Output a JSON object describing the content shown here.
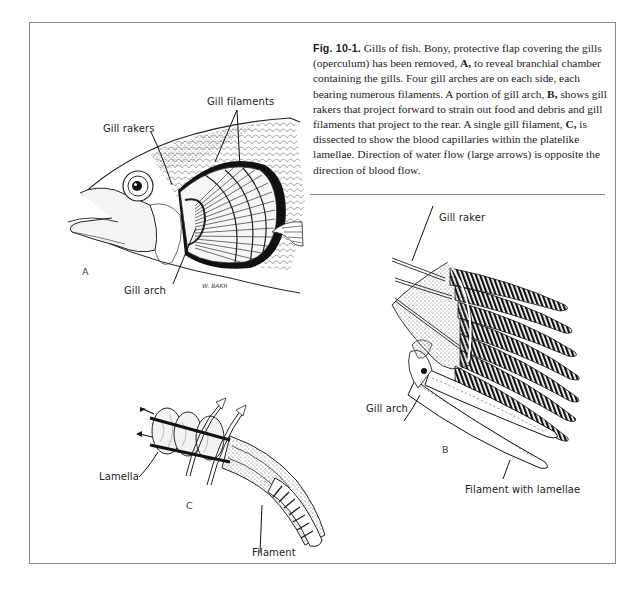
{
  "figure": {
    "number_prefix": "Fig.",
    "number": "10-1.",
    "caption_parts": [
      " Gills of fish. Bony, protective flap covering the gills (operculum) has been removed, ",
      "A,",
      " to reveal branchial chamber containing the gills. Four gill arches are on each side, each bearing numerous filaments. A portion of gill arch, ",
      "B,",
      " shows gill rakers that project forward to strain out food and debris and gill filaments that project to the rear. A single gill filament, ",
      "C,",
      " is dissected to show the blood capillaries within the platelike lamellae. Direction of water flow (large arrows) is opposite the direction of blood flow."
    ]
  },
  "panel_a": {
    "letter": "A",
    "labels": {
      "gill_filaments": "Gill filaments",
      "gill_rakers": "Gill rakers",
      "gill_arch": "Gill arch"
    },
    "signature": "W. BAKR"
  },
  "panel_b": {
    "letter": "B",
    "labels": {
      "gill_raker": "Gill raker",
      "gill_arch": "Gill arch",
      "filament_with_lamellae": "Filament with lamellae"
    }
  },
  "panel_c": {
    "letter": "C",
    "labels": {
      "lamella": "Lamella",
      "filament": "Filament"
    }
  },
  "colors": {
    "frame": "#8a8a8a",
    "ink": "#1a1a1a"
  }
}
